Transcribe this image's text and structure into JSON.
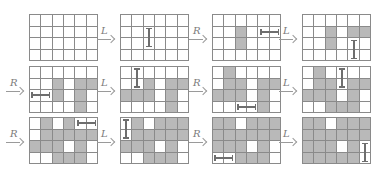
{
  "figure": {
    "grid_rows": 4,
    "grid_cols": 6,
    "colors": {
      "shaded": "#b9b9b9",
      "line": "#8a8a8a",
      "domino": "#6e6e6e"
    },
    "panels": [
      {
        "id": 1,
        "arrow_label": "",
        "shaded": [],
        "domino": null
      },
      {
        "id": 2,
        "arrow_label": "L",
        "shaded": [],
        "domino": {
          "orientation": "vertical",
          "row": 1,
          "col": 2,
          "span": 2
        }
      },
      {
        "id": 3,
        "arrow_label": "R",
        "shaded": [
          [
            1,
            2
          ],
          [
            2,
            2
          ]
        ],
        "domino": {
          "orientation": "horizontal",
          "row": 1,
          "col": 4,
          "span": 2
        }
      },
      {
        "id": 4,
        "arrow_label": "L",
        "shaded": [
          [
            1,
            2
          ],
          [
            2,
            2
          ],
          [
            1,
            4
          ],
          [
            1,
            5
          ]
        ],
        "domino": {
          "orientation": "vertical",
          "row": 2,
          "col": 4,
          "span": 2
        }
      },
      {
        "id": 5,
        "arrow_label": "R",
        "shaded": [
          [
            1,
            2
          ],
          [
            2,
            2
          ],
          [
            1,
            4
          ],
          [
            1,
            5
          ],
          [
            2,
            4
          ],
          [
            3,
            4
          ]
        ],
        "domino": {
          "orientation": "horizontal",
          "row": 2,
          "col": 0,
          "span": 2
        }
      },
      {
        "id": 6,
        "arrow_label": "L",
        "shaded": [
          [
            1,
            2
          ],
          [
            1,
            4
          ],
          [
            1,
            5
          ],
          [
            2,
            0
          ],
          [
            2,
            1
          ],
          [
            2,
            2
          ],
          [
            2,
            4
          ],
          [
            3,
            4
          ]
        ],
        "domino": {
          "orientation": "vertical",
          "row": 0,
          "col": 1,
          "span": 2
        }
      },
      {
        "id": 7,
        "arrow_label": "R",
        "shaded": [
          [
            0,
            1
          ],
          [
            1,
            1
          ],
          [
            1,
            2
          ],
          [
            1,
            4
          ],
          [
            1,
            5
          ],
          [
            2,
            0
          ],
          [
            2,
            1
          ],
          [
            2,
            2
          ],
          [
            2,
            4
          ],
          [
            3,
            4
          ]
        ],
        "domino": {
          "orientation": "horizontal",
          "row": 3,
          "col": 2,
          "span": 2
        }
      },
      {
        "id": 8,
        "arrow_label": "L",
        "shaded": [
          [
            0,
            1
          ],
          [
            1,
            1
          ],
          [
            1,
            2
          ],
          [
            1,
            4
          ],
          [
            1,
            5
          ],
          [
            2,
            0
          ],
          [
            2,
            1
          ],
          [
            2,
            2
          ],
          [
            2,
            4
          ],
          [
            3,
            2
          ],
          [
            3,
            3
          ],
          [
            3,
            4
          ]
        ],
        "domino": {
          "orientation": "vertical",
          "row": 0,
          "col": 3,
          "span": 2
        }
      },
      {
        "id": 9,
        "arrow_label": "R",
        "shaded": [
          [
            0,
            1
          ],
          [
            0,
            3
          ],
          [
            1,
            1
          ],
          [
            1,
            2
          ],
          [
            1,
            3
          ],
          [
            1,
            4
          ],
          [
            1,
            5
          ],
          [
            2,
            0
          ],
          [
            2,
            1
          ],
          [
            2,
            2
          ],
          [
            2,
            4
          ],
          [
            3,
            2
          ],
          [
            3,
            3
          ],
          [
            3,
            4
          ]
        ],
        "domino": {
          "orientation": "horizontal",
          "row": 0,
          "col": 4,
          "span": 2
        }
      },
      {
        "id": 10,
        "arrow_label": "L",
        "shaded": [
          [
            0,
            1
          ],
          [
            0,
            3
          ],
          [
            0,
            4
          ],
          [
            0,
            5
          ],
          [
            1,
            1
          ],
          [
            1,
            2
          ],
          [
            1,
            3
          ],
          [
            1,
            4
          ],
          [
            1,
            5
          ],
          [
            2,
            0
          ],
          [
            2,
            1
          ],
          [
            2,
            2
          ],
          [
            2,
            4
          ],
          [
            3,
            2
          ],
          [
            3,
            3
          ],
          [
            3,
            4
          ]
        ],
        "domino": {
          "orientation": "vertical",
          "row": 0,
          "col": 0,
          "span": 2
        }
      },
      {
        "id": 11,
        "arrow_label": "R",
        "shaded": [
          [
            0,
            0
          ],
          [
            0,
            1
          ],
          [
            0,
            3
          ],
          [
            0,
            4
          ],
          [
            0,
            5
          ],
          [
            1,
            0
          ],
          [
            1,
            1
          ],
          [
            1,
            2
          ],
          [
            1,
            3
          ],
          [
            1,
            4
          ],
          [
            1,
            5
          ],
          [
            2,
            0
          ],
          [
            2,
            1
          ],
          [
            2,
            2
          ],
          [
            2,
            4
          ],
          [
            3,
            2
          ],
          [
            3,
            3
          ],
          [
            3,
            4
          ]
        ],
        "domino": {
          "orientation": "horizontal",
          "row": 3,
          "col": 0,
          "span": 2
        }
      },
      {
        "id": 12,
        "arrow_label": "L",
        "shaded": [
          [
            0,
            0
          ],
          [
            0,
            1
          ],
          [
            0,
            3
          ],
          [
            0,
            4
          ],
          [
            0,
            5
          ],
          [
            1,
            0
          ],
          [
            1,
            1
          ],
          [
            1,
            2
          ],
          [
            1,
            3
          ],
          [
            1,
            4
          ],
          [
            1,
            5
          ],
          [
            2,
            0
          ],
          [
            2,
            1
          ],
          [
            2,
            2
          ],
          [
            2,
            4
          ],
          [
            3,
            0
          ],
          [
            3,
            1
          ],
          [
            3,
            2
          ],
          [
            3,
            3
          ],
          [
            3,
            4
          ]
        ],
        "domino": {
          "orientation": "vertical",
          "row": 2,
          "col": 5,
          "span": 2
        }
      }
    ]
  }
}
